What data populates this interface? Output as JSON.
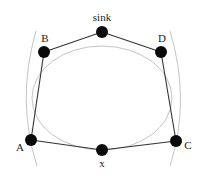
{
  "diagram": {
    "nodes": [
      {
        "id": "sink",
        "label": "sink",
        "x": 102,
        "y": 32,
        "label_x": 102,
        "label_y": 21,
        "anchor": "middle"
      },
      {
        "id": "B",
        "label": "B",
        "x": 44,
        "y": 52,
        "label_x": 45,
        "label_y": 42,
        "anchor": "middle"
      },
      {
        "id": "D",
        "label": "D",
        "x": 161,
        "y": 52,
        "label_x": 162,
        "label_y": 42,
        "anchor": "middle"
      },
      {
        "id": "A",
        "label": "A",
        "x": 31,
        "y": 140,
        "label_x": 20,
        "label_y": 151,
        "anchor": "middle"
      },
      {
        "id": "x",
        "label": "x",
        "x": 102,
        "y": 150,
        "label_x": 102,
        "label_y": 167,
        "anchor": "middle"
      },
      {
        "id": "C",
        "label": "C",
        "x": 176,
        "y": 141,
        "label_x": 188,
        "label_y": 149,
        "anchor": "middle"
      }
    ],
    "edges": [
      [
        "sink",
        "B"
      ],
      [
        "B",
        "A"
      ],
      [
        "A",
        "x"
      ],
      [
        "x",
        "C"
      ],
      [
        "C",
        "D"
      ],
      [
        "D",
        "sink"
      ]
    ],
    "range_curves": {
      "inner_ellipse": {
        "cx": 102,
        "cy": 98,
        "rx": 70,
        "ry": 52
      },
      "left_arc": {
        "path": "M 36 31 Q 16 100 37 166"
      },
      "right_arc": {
        "path": "M 170 31 Q 191 100 170 166"
      }
    },
    "colors": {
      "node": "#0a0a0a",
      "edge": "#333333",
      "range": "#c4c4c4",
      "label": "#222222"
    },
    "node_radius": 6
  }
}
